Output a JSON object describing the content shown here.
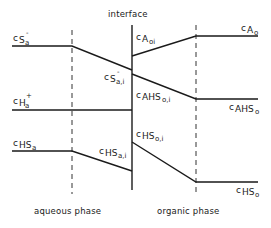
{
  "diagram": {
    "interface_label": "interface",
    "phase_labels": {
      "aqueous": "aqueous phase",
      "organic": "organic phase"
    },
    "concentration_labels": {
      "c_S_a": {
        "base": "c",
        "sub": "S",
        "sup": "-",
        "subsub": "a"
      },
      "c_S_a_i": {
        "base": "c",
        "sub": "S",
        "sup": "-",
        "subsub": "a,i"
      },
      "c_H_a": {
        "base": "c",
        "sub": "H",
        "sup": "+",
        "subsub": "a"
      },
      "c_HS_a": {
        "base": "c",
        "sub": "HS",
        "subsub": "a"
      },
      "c_HS_a_i": {
        "base": "c",
        "sub": "HS",
        "subsub": "a,i"
      },
      "c_A_o_i": {
        "base": "c",
        "sub": "A",
        "subsub": "oi"
      },
      "c_A_o": {
        "base": "c",
        "sub": "A",
        "subsub": "o"
      },
      "c_AHS_o_i": {
        "base": "c",
        "sub": "AHS",
        "subsub": "o,i"
      },
      "c_AHS_o": {
        "base": "c",
        "sub": "AHS",
        "subsub": "o"
      },
      "c_HS_o_i": {
        "base": "c",
        "sub": "HS",
        "subsub": "o,i"
      },
      "c_HS_o": {
        "base": "c",
        "sub": "HS",
        "subsub": "o"
      }
    },
    "profiles": [
      {
        "name": "S-",
        "points": [
          [
            12,
            46
          ],
          [
            72,
            46
          ],
          [
            132,
            70
          ]
        ]
      },
      {
        "name": "A",
        "points": [
          [
            132,
            56
          ],
          [
            196,
            36
          ],
          [
            258,
            36
          ]
        ]
      },
      {
        "name": "AHS",
        "points": [
          [
            132,
            74
          ],
          [
            196,
            99
          ],
          [
            258,
            99
          ]
        ]
      },
      {
        "name": "H+",
        "points": [
          [
            12,
            110
          ],
          [
            132,
            110
          ]
        ]
      },
      {
        "name": "HS aqueous",
        "points": [
          [
            12,
            151
          ],
          [
            72,
            151
          ],
          [
            132,
            171
          ]
        ]
      },
      {
        "name": "HS organic",
        "points": [
          [
            132,
            142
          ],
          [
            196,
            182
          ],
          [
            258,
            182
          ]
        ]
      }
    ],
    "boundaries": {
      "interface_x": 132,
      "aqueous_film_x": 72,
      "organic_film_x": 196
    },
    "colors": {
      "ink": "#1a1a1a",
      "background": "#ffffff"
    }
  }
}
